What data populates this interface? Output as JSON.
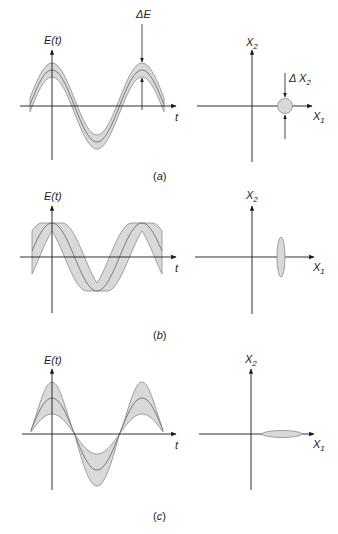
{
  "figure": {
    "panels": [
      {
        "id": "a",
        "caption": "(a)",
        "caption_letter": "a",
        "description": "Coherent state: constant uncertainty band",
        "time_plot": {
          "y_label": "E(t)",
          "x_label": "t",
          "uncertainty_label": "ΔE",
          "band_type": "amplitude-constant"
        },
        "phase_plot": {
          "x_label": "X",
          "x_sub": "1",
          "y_label": "X",
          "y_sub": "2",
          "uncertainty_label": "Δ X",
          "uncertainty_sub": "2",
          "shape": "circle"
        }
      },
      {
        "id": "b",
        "caption": "(b)",
        "caption_letter": "b",
        "description": "Phase-squeezed: amplitude noise larger, band offset horizontally",
        "time_plot": {
          "y_label": "E(t)",
          "x_label": "t",
          "band_type": "phase-broadened"
        },
        "phase_plot": {
          "x_label": "X",
          "x_sub": "1",
          "y_label": "X",
          "y_sub": "2",
          "shape": "vertical-ellipse"
        }
      },
      {
        "id": "c",
        "caption": "(c)",
        "caption_letter": "c",
        "description": "Amplitude-squeezed: noise vanishes at zero crossings",
        "time_plot": {
          "y_label": "E(t)",
          "x_label": "t",
          "band_type": "amplitude-broadened"
        },
        "phase_plot": {
          "x_label": "X",
          "x_sub": "1",
          "y_label": "X",
          "y_sub": "2",
          "shape": "horizontal-ellipse"
        }
      }
    ],
    "colors": {
      "band_fill": "#d9d9d9",
      "band_stroke": "#8a8a8a",
      "axis": "#1a1a1a",
      "text": "#222222"
    }
  }
}
